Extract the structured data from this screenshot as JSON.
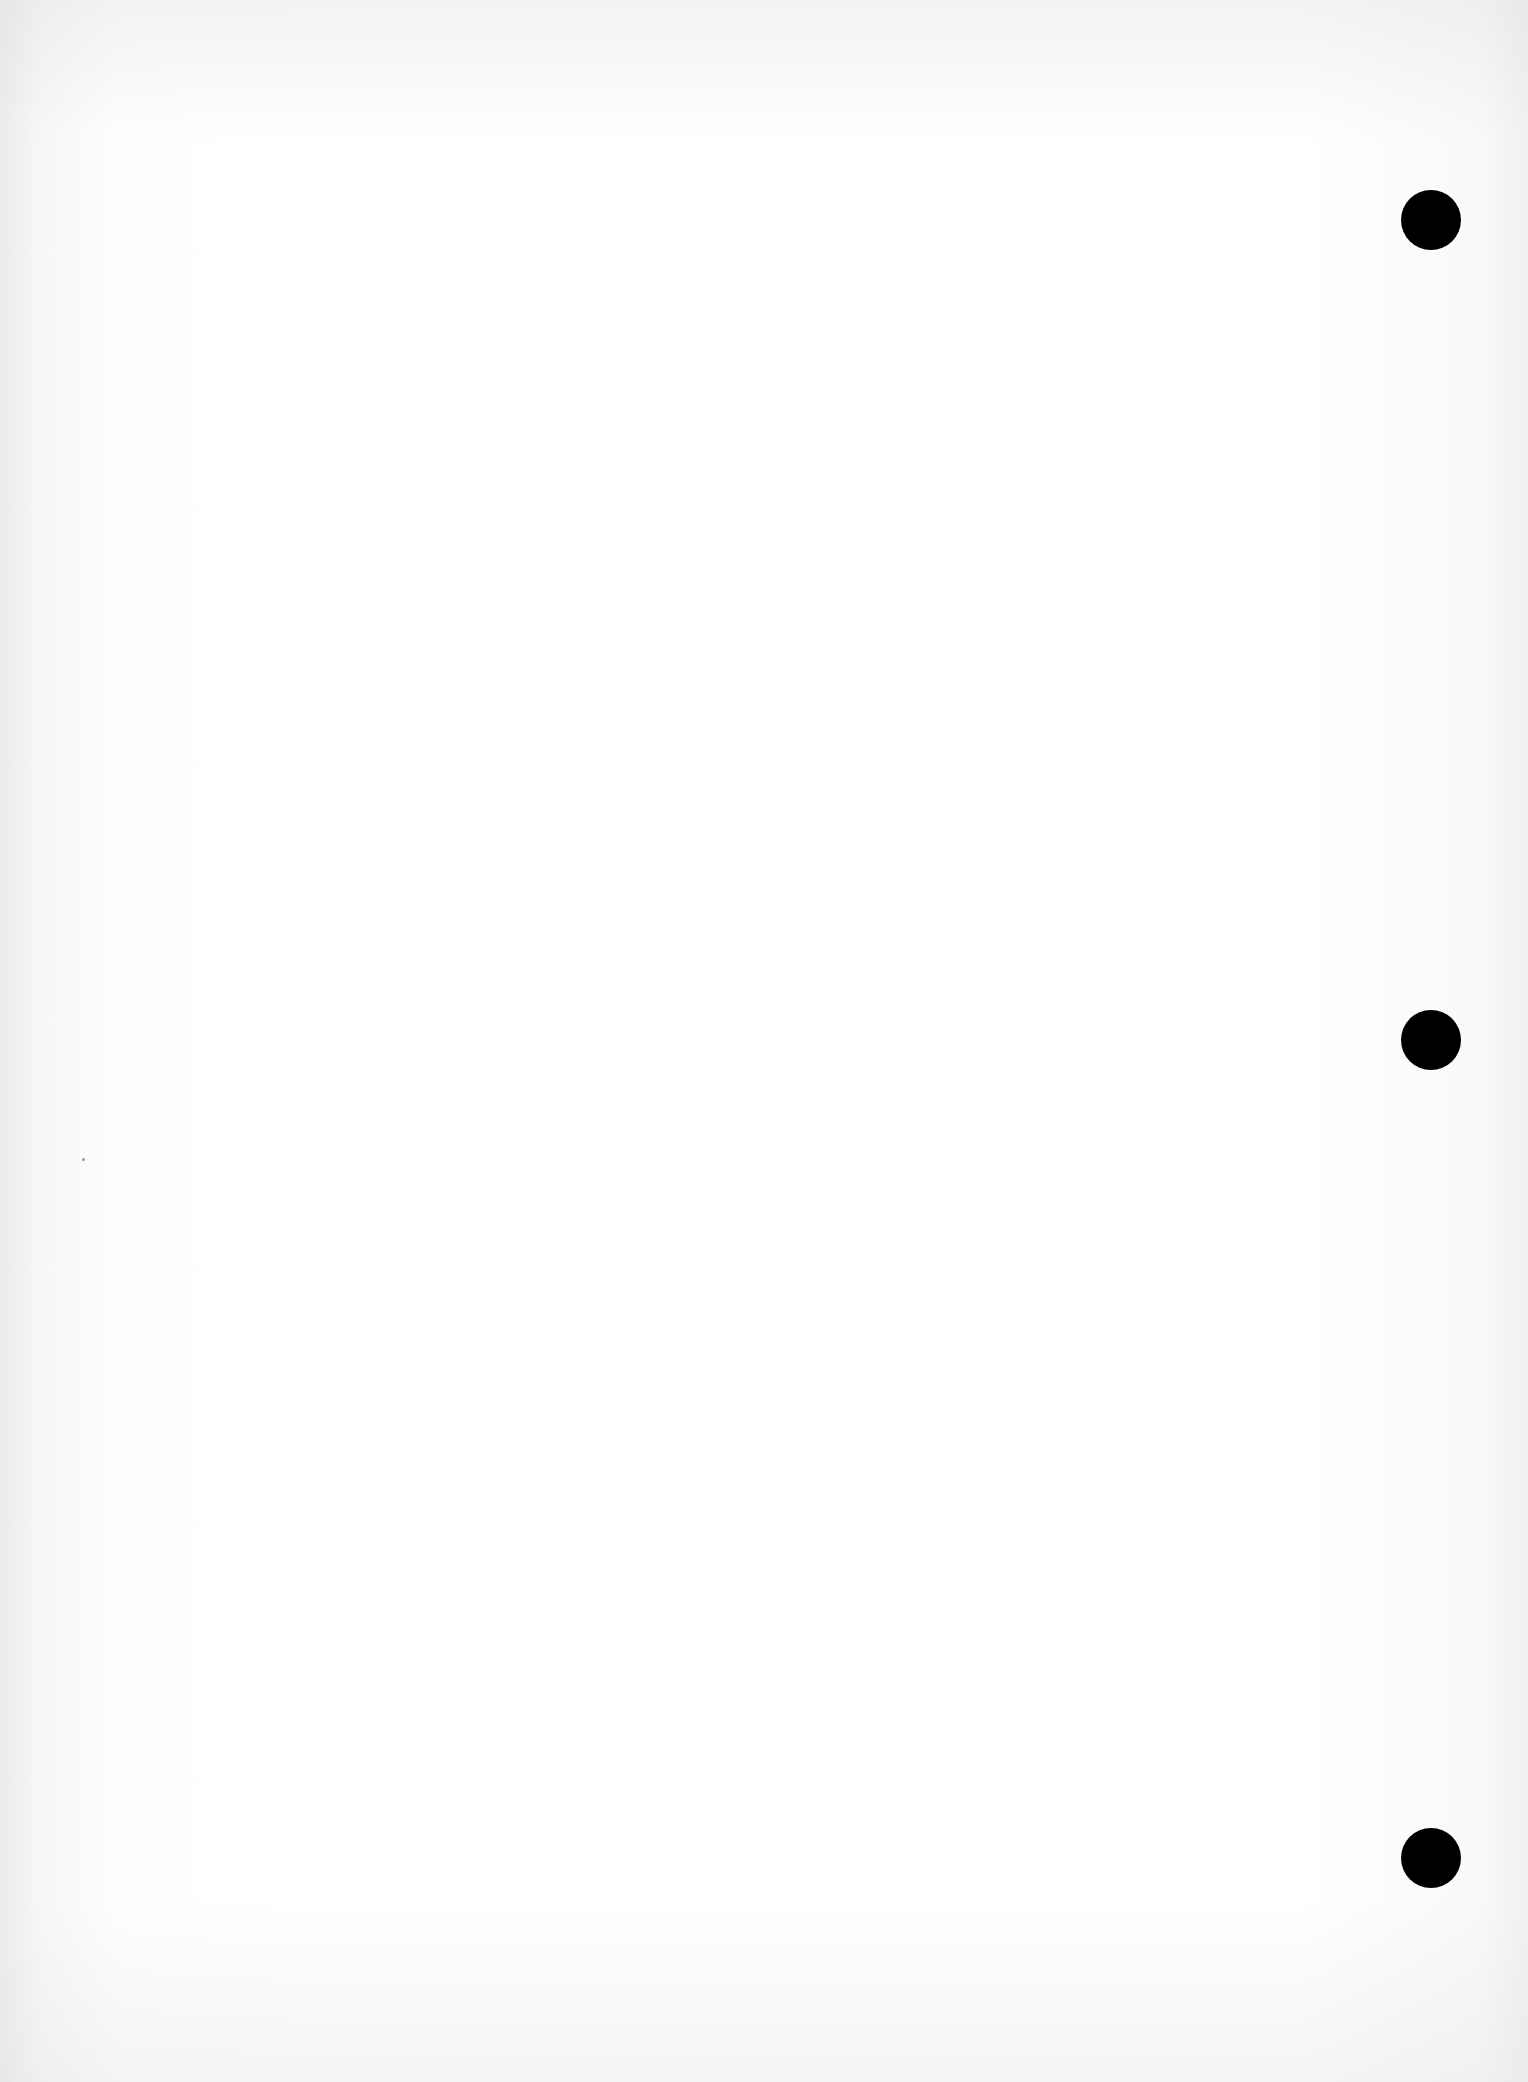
{
  "document": {
    "type": "blank scanned page",
    "text": "",
    "punch_holes": [
      {
        "cx": 1431,
        "cy": 220,
        "diameter": 60
      },
      {
        "cx": 1431,
        "cy": 1040,
        "diameter": 60
      },
      {
        "cx": 1431,
        "cy": 1858,
        "diameter": 60
      }
    ],
    "colors": {
      "paper": "#ffffff",
      "hole": "#000000"
    }
  }
}
